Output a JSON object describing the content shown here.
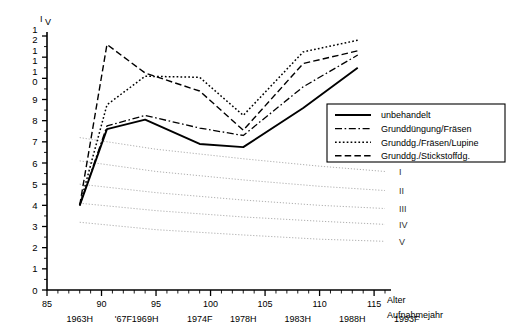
{
  "chart_data": {
    "type": "line",
    "title": "",
    "ylabel": "Iv",
    "ylabel_main": "I",
    "ylabel_sub": "V",
    "xlabel": "Alter",
    "xlabel_secondary": "Aufnahmejahr",
    "xlim": [
      85,
      116
    ],
    "ylim": [
      0,
      12
    ],
    "grid": false,
    "legend_position": "upper right",
    "x_ticks": [
      85,
      90,
      95,
      100,
      105,
      110,
      115
    ],
    "x_tick_labels": [
      "85",
      "90",
      "95",
      "100",
      "105",
      "110",
      "115"
    ],
    "x_tick_minor_step": 1,
    "y_ticks": [
      0,
      1,
      2,
      3,
      4,
      5,
      6,
      7,
      8,
      9,
      10,
      11,
      12
    ],
    "y_tick_labels": [
      "0",
      "1",
      "2",
      "3",
      "4",
      "5",
      "6",
      "7",
      "8",
      "9",
      "10",
      "11",
      "12"
    ],
    "y_tick_minor_step": 0.5,
    "year_axis": [
      {
        "x": 88.0,
        "label": "1963H"
      },
      {
        "x": 92.0,
        "label": "'67F"
      },
      {
        "x": 94.0,
        "label": "1969H"
      },
      {
        "x": 99.0,
        "label": "1974F"
      },
      {
        "x": 103.0,
        "label": "1978H"
      },
      {
        "x": 108.0,
        "label": "1983H"
      },
      {
        "x": 113.0,
        "label": "1988H"
      },
      {
        "x": 118.0,
        "label": "1993F"
      }
    ],
    "x": [
      88,
      90.5,
      94,
      99,
      103,
      108.5,
      113.5
    ],
    "series": [
      {
        "name": "unbehandelt",
        "style": "solid",
        "values": [
          4.0,
          7.6,
          8.05,
          6.9,
          6.75,
          8.6,
          10.5
        ]
      },
      {
        "name": "Grunddüngung/Fräsen",
        "style": "dashdot",
        "values": [
          4.0,
          7.75,
          8.25,
          7.65,
          7.3,
          9.6,
          11.1
        ]
      },
      {
        "name": "Grunddg./Fräsen/Lupine",
        "style": "dotted",
        "values": [
          4.0,
          8.75,
          10.1,
          10.05,
          8.25,
          11.25,
          11.8
        ]
      },
      {
        "name": "Grunddg./Stickstoffdg.",
        "style": "dashed",
        "values": [
          4.0,
          11.6,
          10.25,
          9.4,
          7.55,
          10.7,
          11.3
        ]
      }
    ],
    "reference_lines": [
      {
        "label": "I",
        "x": [
          88,
          95,
          103,
          110,
          116
        ],
        "values": [
          7.2,
          6.65,
          6.2,
          5.85,
          5.6
        ]
      },
      {
        "label": "II",
        "x": [
          88,
          95,
          103,
          110,
          116
        ],
        "values": [
          6.1,
          5.6,
          5.2,
          4.9,
          4.7
        ]
      },
      {
        "label": "III",
        "x": [
          88,
          95,
          103,
          110,
          116
        ],
        "values": [
          5.0,
          4.6,
          4.25,
          4.0,
          3.85
        ]
      },
      {
        "label": "IV",
        "x": [
          88,
          95,
          103,
          110,
          116
        ],
        "values": [
          4.1,
          3.75,
          3.45,
          3.25,
          3.1
        ]
      },
      {
        "label": "V",
        "x": [
          88,
          95,
          103,
          110,
          116
        ],
        "values": [
          3.2,
          2.85,
          2.6,
          2.4,
          2.3
        ]
      }
    ],
    "legend_entries": [
      {
        "label": "unbehandelt",
        "style": "solid"
      },
      {
        "label": "Grunddüngung/Fräsen",
        "style": "dashdot"
      },
      {
        "label": "Grunddg./Fräsen/Lupine",
        "style": "dotted"
      },
      {
        "label": "Grunddg./Stickstoffdg.",
        "style": "dashed"
      }
    ],
    "colors": {
      "line": "#000000",
      "reference_line": "#9a9a9a",
      "background": "#ffffff",
      "axis": "#000000"
    }
  }
}
